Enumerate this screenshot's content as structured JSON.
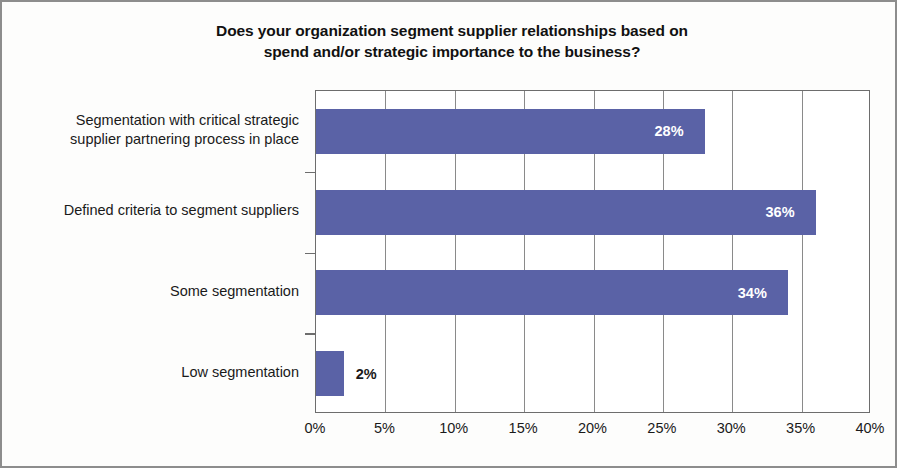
{
  "chart_data": {
    "type": "bar",
    "orientation": "horizontal",
    "title": "Does your organization segment supplier relationships based on spend and/or strategic importance to the business?",
    "title_lines": [
      "Does your organization segment supplier relationships based on",
      "spend and/or strategic importance to the business?"
    ],
    "categories": [
      "Segmentation with critical strategic supplier partnering process in place",
      "Defined criteria to segment suppliers",
      "Some segmentation",
      "Low segmentation"
    ],
    "category_lines": [
      [
        "Segmentation with critical strategic",
        "supplier partnering process in place"
      ],
      [
        "Defined criteria to segment suppliers"
      ],
      [
        "Some segmentation"
      ],
      [
        "Low segmentation"
      ]
    ],
    "values": [
      28,
      36,
      34,
      2
    ],
    "data_labels": [
      "28%",
      "36%",
      "34%",
      "2%"
    ],
    "xlabel": "",
    "ylabel": "",
    "xlim": [
      0,
      40
    ],
    "xtick_values": [
      0,
      5,
      10,
      15,
      20,
      25,
      30,
      35,
      40
    ],
    "xtick_labels": [
      "0%",
      "5%",
      "10%",
      "15%",
      "20%",
      "25%",
      "30%",
      "35%",
      "40%"
    ],
    "grid": "vertical",
    "legend": "none",
    "bar_color": "#5a62a6",
    "label_color_inside": "#ffffff",
    "label_color_outside": "#1a1a1a",
    "plot_border_color": "#6d6d6d",
    "background_color": "#fdfdfc"
  }
}
